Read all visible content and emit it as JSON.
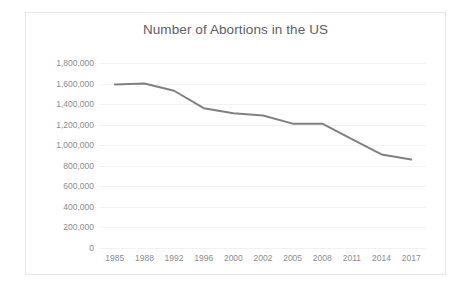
{
  "chart_data": {
    "type": "line",
    "title": "Number of Abortions in the US",
    "xlabel": "",
    "ylabel": "",
    "categories": [
      "1985",
      "1988",
      "1992",
      "1996",
      "2000",
      "2002",
      "2005",
      "2008",
      "2011",
      "2014",
      "2017"
    ],
    "series": [
      {
        "name": "Number of Abortions",
        "values": [
          1590000,
          1600000,
          1530000,
          1360000,
          1310000,
          1290000,
          1210000,
          1210000,
          1060000,
          910000,
          860000
        ],
        "color": "#808080"
      }
    ],
    "ylim": [
      0,
      1800000
    ],
    "ytick_values": [
      0,
      200000,
      400000,
      600000,
      800000,
      1000000,
      1200000,
      1400000,
      1600000,
      1800000
    ],
    "ytick_labels": [
      "0",
      "200,000",
      "400,000",
      "600,000",
      "800,000",
      "1,000,000",
      "1,200,000",
      "1,400,000",
      "1,600,000",
      "1,800,000"
    ],
    "grid": true,
    "legend": false,
    "legend_position": "none",
    "markers": false,
    "background_color": "#ffffff",
    "border_color": "#e8e8e8",
    "title_color": "#5e5e5e",
    "tick_label_color": "#8c8c8c",
    "gridline_color": "#f1f1f1"
  }
}
